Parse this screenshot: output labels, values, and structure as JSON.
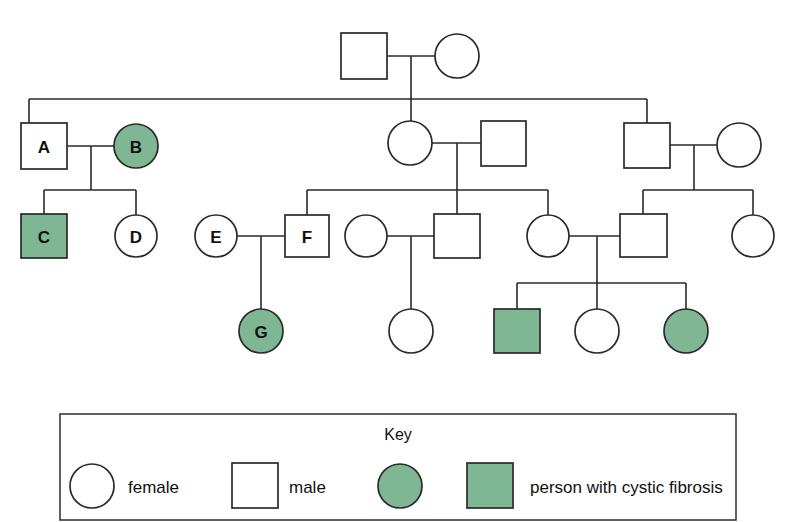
{
  "diagram": {
    "type": "pedigree-chart",
    "colors": {
      "affected_fill": "#7fb795",
      "unaffected_fill": "#ffffff",
      "stroke": "#2a2a2a",
      "background": "#ffffff"
    },
    "symbols": {
      "female": "circle",
      "male": "square",
      "affected": "shaded"
    }
  },
  "key": {
    "title": "Key",
    "entries": [
      {
        "id": "key-female",
        "shape": "circle",
        "state": "unaffected",
        "label": "female"
      },
      {
        "id": "key-male",
        "shape": "square",
        "state": "unaffected",
        "label": "male"
      },
      {
        "id": "key-affected",
        "shape": "circle-and-square",
        "state": "affected",
        "label": "person with cystic fibrosis"
      }
    ]
  },
  "people": [
    {
      "id": "g1-m",
      "generation": 1,
      "sex": "male",
      "affected": false,
      "label": "",
      "cx": 364,
      "cy": 56
    },
    {
      "id": "g1-f",
      "generation": 1,
      "sex": "female",
      "affected": false,
      "label": "",
      "cx": 457,
      "cy": 56
    },
    {
      "id": "A",
      "generation": 2,
      "sex": "male",
      "affected": false,
      "label": "A",
      "cx": 44,
      "cy": 146
    },
    {
      "id": "B",
      "generation": 2,
      "sex": "female",
      "affected": true,
      "label": "B",
      "cx": 136,
      "cy": 146
    },
    {
      "id": "g2-f1",
      "generation": 2,
      "sex": "female",
      "affected": false,
      "label": "",
      "cx": 410,
      "cy": 143
    },
    {
      "id": "g2-m1",
      "generation": 2,
      "sex": "male",
      "affected": false,
      "label": "",
      "cx": 503,
      "cy": 143
    },
    {
      "id": "g2-m2",
      "generation": 2,
      "sex": "male",
      "affected": false,
      "label": "",
      "cx": 647,
      "cy": 145
    },
    {
      "id": "g2-f2",
      "generation": 2,
      "sex": "female",
      "affected": false,
      "label": "",
      "cx": 739,
      "cy": 145
    },
    {
      "id": "C",
      "generation": 3,
      "sex": "male",
      "affected": true,
      "label": "C",
      "cx": 44,
      "cy": 236
    },
    {
      "id": "D",
      "generation": 3,
      "sex": "female",
      "affected": false,
      "label": "D",
      "cx": 136,
      "cy": 236
    },
    {
      "id": "E",
      "generation": 3,
      "sex": "female",
      "affected": false,
      "label": "E",
      "cx": 216,
      "cy": 236
    },
    {
      "id": "F",
      "generation": 3,
      "sex": "male",
      "affected": false,
      "label": "F",
      "cx": 307,
      "cy": 236
    },
    {
      "id": "g3-f1",
      "generation": 3,
      "sex": "female",
      "affected": false,
      "label": "",
      "cx": 366,
      "cy": 236
    },
    {
      "id": "g3-m1",
      "generation": 3,
      "sex": "male",
      "affected": false,
      "label": "",
      "cx": 457,
      "cy": 236
    },
    {
      "id": "g3-f2",
      "generation": 3,
      "sex": "female",
      "affected": false,
      "label": "",
      "cx": 548,
      "cy": 236
    },
    {
      "id": "g3-m2",
      "generation": 3,
      "sex": "male",
      "affected": false,
      "label": "",
      "cx": 643,
      "cy": 236
    },
    {
      "id": "g3-f3",
      "generation": 3,
      "sex": "female",
      "affected": false,
      "label": "",
      "cx": 753,
      "cy": 236
    },
    {
      "id": "G",
      "generation": 4,
      "sex": "female",
      "affected": true,
      "label": "G",
      "cx": 261,
      "cy": 331
    },
    {
      "id": "g4-f1",
      "generation": 4,
      "sex": "female",
      "affected": false,
      "label": "",
      "cx": 411,
      "cy": 331
    },
    {
      "id": "g4-m1",
      "generation": 4,
      "sex": "male",
      "affected": true,
      "label": "",
      "cx": 517,
      "cy": 331
    },
    {
      "id": "g4-f2",
      "generation": 4,
      "sex": "female",
      "affected": false,
      "label": "",
      "cx": 597,
      "cy": 331
    },
    {
      "id": "g4-f3",
      "generation": 4,
      "sex": "female",
      "affected": true,
      "label": "",
      "cx": 686,
      "cy": 331
    }
  ],
  "matings": [
    {
      "id": "mating-g1",
      "partners": [
        "g1-m",
        "g1-f"
      ],
      "children": [
        "A-spouse-branch",
        "g2-f1",
        "g2-m2"
      ]
    },
    {
      "id": "mating-A-B",
      "partners": [
        "A",
        "B"
      ],
      "children": [
        "C",
        "D"
      ]
    },
    {
      "id": "mating-g2f1-m1",
      "partners": [
        "g2-f1",
        "g2-m1"
      ],
      "children": [
        "F",
        "g3-m1",
        "g3-f2"
      ]
    },
    {
      "id": "mating-g2m2-f2",
      "partners": [
        "g2-m2",
        "g2-f2"
      ],
      "children": [
        "g3-m2",
        "g3-f3"
      ]
    },
    {
      "id": "mating-E-F",
      "partners": [
        "E",
        "F"
      ],
      "children": [
        "G"
      ]
    },
    {
      "id": "mating-g3f1-m1",
      "partners": [
        "g3-f1",
        "g3-m1"
      ],
      "children": [
        "g4-f1"
      ]
    },
    {
      "id": "mating-g3f2-m2",
      "partners": [
        "g3-f2",
        "g3-m2"
      ],
      "children": [
        "g4-m1",
        "g4-f2",
        "g4-f3"
      ]
    }
  ],
  "counts": {
    "total_people": 22,
    "affected_people": 5,
    "generations": 4,
    "labelled_people": [
      "A",
      "B",
      "C",
      "D",
      "E",
      "F",
      "G"
    ]
  }
}
